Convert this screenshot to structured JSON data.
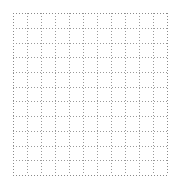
{
  "figure": {
    "background_color": "#ffffff",
    "width": 179,
    "height": 185,
    "plot_area": {
      "left": 13,
      "top": 13,
      "width": 154,
      "height": 162
    }
  },
  "chart_data": {
    "type": "line",
    "title": "",
    "subtitle": "",
    "xlabel": "",
    "ylabel": "",
    "series": [],
    "categories": [],
    "values": [],
    "annotations": [],
    "legend": {
      "entries": [],
      "position": "none",
      "visible": false
    },
    "grid": {
      "visible": true,
      "style": "dotted",
      "color": "#9a9a9a",
      "edge_color": "#8a8a8a",
      "line_width": 1,
      "dot_period_px": 3,
      "x_gridline_positions": [
        0,
        14,
        28,
        42,
        56,
        70,
        84,
        98,
        112,
        126,
        140,
        154
      ],
      "y_gridline_positions": [
        0,
        14.7,
        29.5,
        44.2,
        59,
        73.6,
        88.4,
        103.1,
        117.8,
        132.5,
        147.3,
        162
      ],
      "x_cell_count": 11,
      "y_cell_count": 11
    },
    "axes": {
      "x": {
        "visible_spine": false,
        "tick_labels": [],
        "tick_marks": false,
        "range": null
      },
      "y": {
        "visible_spine": false,
        "tick_labels": [],
        "tick_marks": false,
        "range": null
      }
    }
  }
}
